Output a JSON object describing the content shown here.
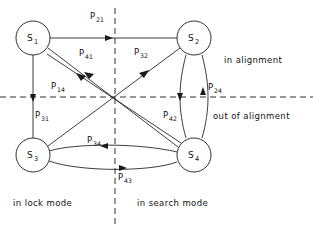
{
  "diagram": {
    "nodes": [
      {
        "id": "S1",
        "label": "S",
        "sub": "1",
        "cx": 33,
        "cy": 38,
        "r": 17
      },
      {
        "id": "S2",
        "label": "S",
        "sub": "2",
        "cx": 194,
        "cy": 38,
        "r": 17
      },
      {
        "id": "S3",
        "label": "S",
        "sub": "3",
        "cx": 33,
        "cy": 155,
        "r": 17
      },
      {
        "id": "S4",
        "label": "S",
        "sub": "4",
        "cx": 194,
        "cy": 155,
        "r": 17
      }
    ],
    "edges": [
      {
        "id": "e21",
        "from": "S1",
        "to": "S2",
        "label": "P",
        "sub": "21",
        "label_x": 90,
        "label_y": 19
      },
      {
        "id": "e41",
        "from": "S4",
        "to": "S1",
        "label": "P",
        "sub": "41",
        "label_x": 79,
        "label_y": 56
      },
      {
        "id": "e32",
        "from": "S3",
        "to": "S2",
        "label": "P",
        "sub": "32",
        "label_x": 134,
        "label_y": 55
      },
      {
        "id": "e14",
        "from": "S1",
        "to": "S4",
        "label": "P",
        "sub": "14",
        "label_x": 51,
        "label_y": 89
      },
      {
        "id": "e31",
        "from": "S1",
        "to": "S3",
        "label": "P",
        "sub": "31",
        "label_x": 35,
        "label_y": 118
      },
      {
        "id": "e24",
        "from": "S4",
        "to": "S2",
        "label": "P",
        "sub": "24",
        "label_x": 208,
        "label_y": 90
      },
      {
        "id": "e42",
        "from": "S2",
        "to": "S4",
        "label": "P",
        "sub": "42",
        "label_x": 163,
        "label_y": 118
      },
      {
        "id": "e34",
        "from": "S4",
        "to": "S3",
        "label": "P",
        "sub": "34",
        "label_x": 87,
        "label_y": 143
      },
      {
        "id": "e43",
        "from": "S3",
        "to": "S4",
        "label": "P",
        "sub": "43",
        "label_x": 118,
        "label_y": 180
      }
    ],
    "regions": [
      {
        "id": "in-alignment",
        "text": "in alignment",
        "x": 224,
        "y": 63
      },
      {
        "id": "out-of-alignment",
        "text": "out of alignment",
        "x": 213,
        "y": 119
      },
      {
        "id": "in-lock-mode",
        "text": "in lock mode",
        "x": 13,
        "y": 206
      },
      {
        "id": "in-search-mode",
        "text": "in search mode",
        "x": 137,
        "y": 206
      }
    ],
    "dividers": {
      "horizontal_y": 97,
      "vertical_x": 115
    },
    "colors": {
      "stroke": "#1a1a1a",
      "background": "#ffffff"
    }
  }
}
